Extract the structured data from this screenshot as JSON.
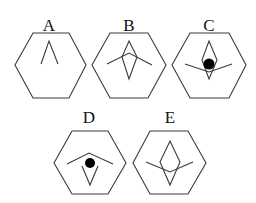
{
  "figure": {
    "stroke_color": "#3a3a3a",
    "dot_color": "#000000",
    "panels": [
      {
        "label": "A",
        "contents": [
          "caret"
        ]
      },
      {
        "label": "B",
        "contents": [
          "diamond",
          "roof"
        ]
      },
      {
        "label": "C",
        "contents": [
          "diamond",
          "dot",
          "smile"
        ]
      },
      {
        "label": "D",
        "contents": [
          "roof",
          "dot",
          "v"
        ]
      },
      {
        "label": "E",
        "contents": [
          "diamond",
          "smile"
        ]
      }
    ]
  }
}
